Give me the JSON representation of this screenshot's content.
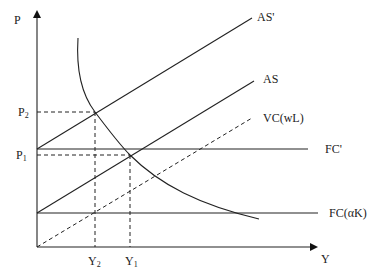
{
  "diagram": {
    "axes": {
      "y_label": "P",
      "x_label": "Y"
    },
    "price_ticks": [
      {
        "label": "P",
        "sub": "2"
      },
      {
        "label": "P",
        "sub": "1"
      }
    ],
    "output_ticks": [
      {
        "label": "Y",
        "sub": "2"
      },
      {
        "label": "Y",
        "sub": "1"
      }
    ],
    "curves": {
      "as_prime": "AS'",
      "as": "AS",
      "vc": "VC(wL)",
      "fc_prime": "FC'",
      "fc": "FC(αK)"
    }
  }
}
